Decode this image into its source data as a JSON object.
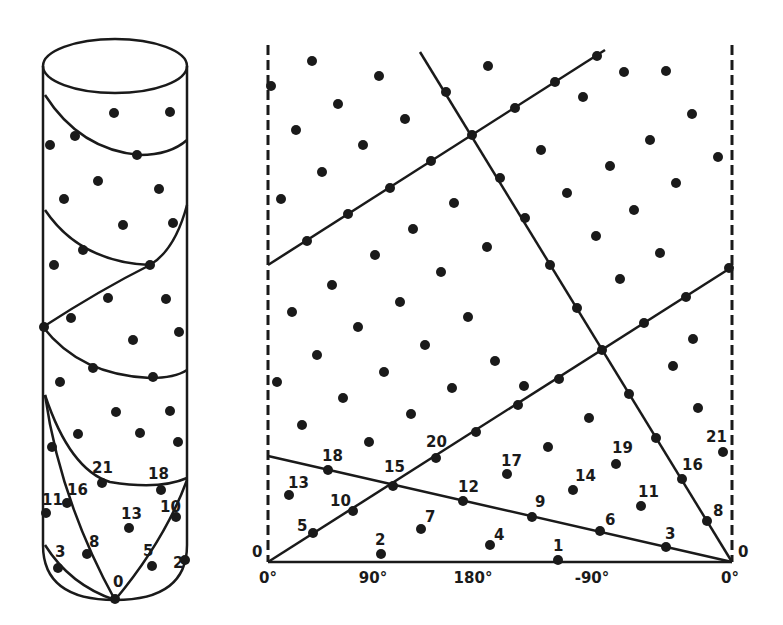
{
  "figure": {
    "ink_color": "#1a1a1a",
    "background": "#ffffff",
    "cylinder": {
      "labels": [
        {
          "text": "21",
          "x": 92,
          "y": 473
        },
        {
          "text": "18",
          "x": 148,
          "y": 479
        },
        {
          "text": "11",
          "x": 42,
          "y": 505
        },
        {
          "text": "16",
          "x": 67,
          "y": 495
        },
        {
          "text": "13",
          "x": 121,
          "y": 519
        },
        {
          "text": "10",
          "x": 160,
          "y": 512
        },
        {
          "text": "8",
          "x": 89,
          "y": 547
        },
        {
          "text": "3",
          "x": 55,
          "y": 557
        },
        {
          "text": "5",
          "x": 143,
          "y": 556
        },
        {
          "text": "2",
          "x": 173,
          "y": 568
        },
        {
          "text": "0",
          "x": 113,
          "y": 587
        }
      ]
    },
    "unrolled": {
      "x_axis": {
        "ticks": [
          {
            "text": "0°",
            "x": 268
          },
          {
            "text": "90°",
            "x": 373
          },
          {
            "text": "180°",
            "x": 473
          },
          {
            "text": "-90°",
            "x": 592
          },
          {
            "text": "0°",
            "x": 724
          }
        ],
        "y": 583
      },
      "edge_labels": [
        {
          "text": "0",
          "x": 254,
          "y": 556
        },
        {
          "text": "0",
          "x": 738,
          "y": 556
        }
      ],
      "point_labels": [
        {
          "text": "1",
          "x": 553,
          "y": 551
        },
        {
          "text": "2",
          "x": 375,
          "y": 545
        },
        {
          "text": "3",
          "x": 665,
          "y": 539
        },
        {
          "text": "4",
          "x": 494,
          "y": 540
        },
        {
          "text": "5",
          "x": 297,
          "y": 531
        },
        {
          "text": "6",
          "x": 605,
          "y": 525
        },
        {
          "text": "7",
          "x": 425,
          "y": 522
        },
        {
          "text": "8",
          "x": 713,
          "y": 516
        },
        {
          "text": "9",
          "x": 535,
          "y": 507
        },
        {
          "text": "10",
          "x": 330,
          "y": 506
        },
        {
          "text": "11",
          "x": 638,
          "y": 497
        },
        {
          "text": "12",
          "x": 458,
          "y": 492
        },
        {
          "text": "13",
          "x": 288,
          "y": 488
        },
        {
          "text": "14",
          "x": 575,
          "y": 481
        },
        {
          "text": "15",
          "x": 384,
          "y": 472
        },
        {
          "text": "16",
          "x": 682,
          "y": 470
        },
        {
          "text": "17",
          "x": 501,
          "y": 466
        },
        {
          "text": "18",
          "x": 322,
          "y": 461
        },
        {
          "text": "19",
          "x": 612,
          "y": 453
        },
        {
          "text": "20",
          "x": 426,
          "y": 447
        },
        {
          "text": "21",
          "x": 706,
          "y": 442
        }
      ]
    }
  }
}
